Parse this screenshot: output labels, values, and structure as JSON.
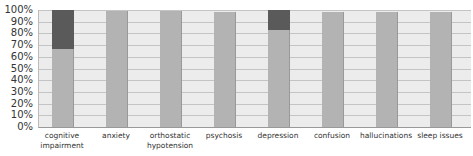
{
  "chart_data": {
    "type": "bar",
    "stacked": true,
    "percent_stacked": true,
    "title": "",
    "xlabel": "",
    "ylabel": "",
    "ylim": [
      0,
      100
    ],
    "yticks": [
      "0%",
      "10%",
      "20%",
      "30%",
      "40%",
      "50%",
      "60%",
      "70%",
      "80%",
      "90%",
      "100%"
    ],
    "grid": true,
    "legend": null,
    "categories": [
      "cognitive impairment",
      "anxiety",
      "orthostatic hypotension",
      "psychosis",
      "depression",
      "confusion",
      "hallucinations",
      "sleep issues"
    ],
    "category_lines": [
      [
        "cognitive",
        "impairment"
      ],
      [
        "anxiety"
      ],
      [
        "orthostatic",
        "hypotension"
      ],
      [
        "psychosis"
      ],
      [
        "depression"
      ],
      [
        "confusion"
      ],
      [
        "hallucinations"
      ],
      [
        "sleep issues"
      ]
    ],
    "series": [
      {
        "name": "series 1",
        "color": "#b3b3b3",
        "values": [
          67,
          99,
          99,
          98,
          83,
          98,
          98,
          98
        ]
      },
      {
        "name": "series 2",
        "color": "#5a5a5a",
        "values": [
          33,
          0,
          0,
          0,
          17,
          0,
          0,
          0
        ]
      }
    ]
  }
}
